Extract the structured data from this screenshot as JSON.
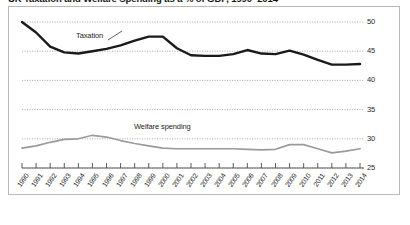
{
  "title": "UK Taxation and Welfare Spending as a % of GDP, 1990–2014",
  "series_labels": {
    "taxation": "Taxation",
    "welfare": "Welfare spending"
  },
  "colors": {
    "taxation": "#1a1a1a",
    "welfare": "#9b9b9b",
    "grid": "#9a9a9a",
    "axis": "#4a4a4a",
    "frame": "#b9b9b9"
  },
  "chart_data": {
    "type": "line",
    "title": "UK Taxation and Welfare Spending as a % of GDP, 1990–2014",
    "xlabel": "",
    "ylabel": "",
    "ylim": [
      25,
      50
    ],
    "yticks": [
      25,
      30,
      35,
      40,
      45,
      50
    ],
    "grid": true,
    "y_axis_position": "right",
    "legend": "inline-labels",
    "categories": [
      "1990",
      "1991",
      "1992",
      "1993",
      "1994",
      "1995",
      "1996",
      "1997",
      "1998",
      "1999",
      "2000",
      "2001",
      "2002",
      "2003",
      "2004",
      "2005",
      "2006",
      "2007",
      "2008",
      "2009",
      "2010",
      "2011",
      "2012",
      "2013",
      "2014"
    ],
    "series": [
      {
        "name": "Taxation",
        "color": "#1a1a1a",
        "values": [
          50.0,
          48.2,
          45.8,
          44.8,
          44.6,
          45.0,
          45.4,
          46.0,
          46.8,
          47.5,
          47.5,
          45.5,
          44.3,
          44.2,
          44.2,
          44.5,
          45.2,
          44.6,
          44.5,
          45.1,
          44.4,
          43.5,
          42.7,
          42.7,
          42.8
        ]
      },
      {
        "name": "Welfare spending",
        "color": "#9b9b9b",
        "values": [
          28.4,
          28.8,
          29.4,
          29.9,
          30.0,
          30.6,
          30.3,
          29.7,
          29.2,
          28.8,
          28.4,
          28.3,
          28.3,
          28.3,
          28.3,
          28.3,
          28.2,
          28.1,
          28.2,
          29.0,
          29.0,
          28.3,
          27.6,
          27.9,
          28.3
        ]
      }
    ]
  }
}
